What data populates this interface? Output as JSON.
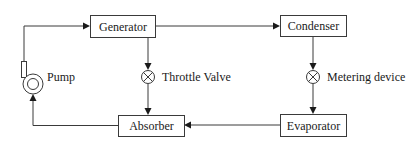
{
  "diagram": {
    "type": "absorption-refrigeration-cycle",
    "components": {
      "generator": {
        "label": "Generator"
      },
      "condenser": {
        "label": "Condenser"
      },
      "absorber": {
        "label": "Absorber"
      },
      "evaporator": {
        "label": "Evaporator"
      },
      "pump": {
        "label": "Pump",
        "icon": "pump-icon"
      },
      "throttle_valve": {
        "label": "Throttle Valve",
        "icon": "valve-icon"
      },
      "metering_device": {
        "label": "Metering device",
        "icon": "valve-icon"
      }
    },
    "flows": [
      {
        "from": "Pump",
        "to": "Generator"
      },
      {
        "from": "Generator",
        "to": "Condenser"
      },
      {
        "from": "Generator",
        "to": "Throttle Valve"
      },
      {
        "from": "Throttle Valve",
        "to": "Absorber"
      },
      {
        "from": "Condenser",
        "to": "Metering device"
      },
      {
        "from": "Metering device",
        "to": "Evaporator"
      },
      {
        "from": "Evaporator",
        "to": "Absorber"
      },
      {
        "from": "Absorber",
        "to": "Pump"
      }
    ],
    "colors": {
      "stroke": "#3a3a3a",
      "text": "#1a1a1a",
      "background": "#ffffff"
    }
  }
}
